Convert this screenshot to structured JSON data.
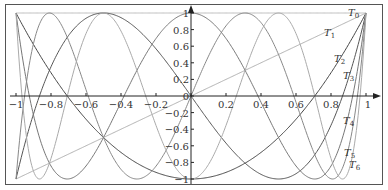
{
  "chart_data": {
    "type": "line",
    "title": "",
    "xlabel": "",
    "ylabel": "",
    "xlim": [
      -1,
      1
    ],
    "ylim": [
      -1,
      1
    ],
    "grid": false,
    "legend_position": "inline-right",
    "x_ticks": [
      -1,
      -0.8,
      -0.6,
      -0.4,
      -0.2,
      0,
      0.2,
      0.4,
      0.6,
      0.8,
      1
    ],
    "x_tick_labels": [
      "−1",
      "−0.8",
      "−0.6",
      "−0.4",
      "−0.2",
      "0",
      "0.2",
      "0.4",
      "0.6",
      "0.8",
      "1"
    ],
    "y_ticks": [
      -1,
      -0.8,
      -0.6,
      -0.4,
      -0.2,
      0,
      0.2,
      0.4,
      0.6,
      0.8,
      1
    ],
    "y_tick_labels": [
      "−1",
      "−0.8",
      "−0.6",
      "−0.4",
      "−0.2",
      "0",
      "0.2",
      "0.4",
      "0.6",
      "0.8",
      "1"
    ],
    "series": [
      {
        "name": "T0",
        "label_main": "T",
        "label_sub": "0",
        "degree": 0,
        "color": "#bbbbbb",
        "label_pos": [
          348,
          16
        ]
      },
      {
        "name": "T1",
        "label_main": "T",
        "label_sub": "1",
        "degree": 1,
        "color": "#b0b0b0",
        "label_pos": [
          324,
          36
        ]
      },
      {
        "name": "T2",
        "label_main": "T",
        "label_sub": "2",
        "degree": 2,
        "color": "#444444",
        "label_pos": [
          334,
          62
        ]
      },
      {
        "name": "T3",
        "label_main": "T",
        "label_sub": "3",
        "degree": 3,
        "color": "#555555",
        "label_pos": [
          343,
          79
        ]
      },
      {
        "name": "T4",
        "label_main": "T",
        "label_sub": "4",
        "degree": 4,
        "color": "#777777",
        "label_pos": [
          343,
          124
        ]
      },
      {
        "name": "T5",
        "label_main": "T",
        "label_sub": "5",
        "degree": 5,
        "color": "#888888",
        "label_pos": [
          344,
          156
        ]
      },
      {
        "name": "T6",
        "label_main": "T",
        "label_sub": "6",
        "degree": 6,
        "color": "#aaaaaa",
        "label_pos": [
          349,
          168
        ]
      }
    ],
    "sample_values": {
      "x": [
        -1,
        -0.8,
        -0.6,
        -0.4,
        -0.2,
        0,
        0.2,
        0.4,
        0.6,
        0.8,
        1
      ],
      "T0": [
        1,
        1,
        1,
        1,
        1,
        1,
        1,
        1,
        1,
        1,
        1
      ],
      "T1": [
        -1,
        -0.8,
        -0.6,
        -0.4,
        -0.2,
        0,
        0.2,
        0.4,
        0.6,
        0.8,
        1
      ],
      "T2": [
        1,
        0.28,
        -0.28,
        -0.68,
        -0.92,
        -1,
        -0.92,
        -0.68,
        -0.28,
        0.28,
        1
      ],
      "T3": [
        -1,
        0.352,
        0.936,
        0.848,
        0.568,
        0,
        -0.568,
        -0.848,
        -0.936,
        -0.352,
        1
      ],
      "T4": [
        1,
        -0.8432,
        -0.6992,
        0.3088,
        0.6928,
        1,
        0.6928,
        0.3088,
        -0.6992,
        -0.8432,
        1
      ],
      "T5": [
        -1,
        -0.9971,
        0.0025,
        0.9997,
        0.4691,
        0,
        -0.4691,
        -0.9997,
        -0.0025,
        0.9971,
        1
      ],
      "T6": [
        1,
        -0.7521,
        0.7024,
        0.447,
        -0.3645,
        -1,
        -0.3645,
        0.447,
        0.7024,
        -0.7521,
        1
      ]
    }
  },
  "frame": {
    "border_color": "#333333"
  },
  "axes": {
    "color": "#222222"
  }
}
